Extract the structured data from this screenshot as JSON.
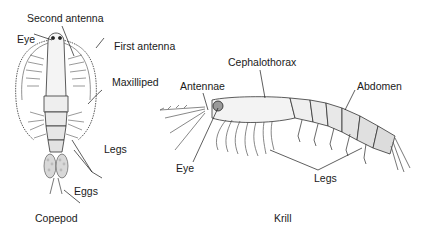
{
  "diagram": {
    "copepod": {
      "caption": "Copepod",
      "labels": {
        "second_antenna": "Second antenna",
        "eye": "Eye",
        "first_antenna": "First antenna",
        "maxilliped": "Maxilliped",
        "legs": "Legs",
        "eggs": "Eggs"
      }
    },
    "krill": {
      "caption": "Krill",
      "labels": {
        "cephalothorax": "Cephalothorax",
        "antennae": "Antennae",
        "abdomen": "Abdomen",
        "eye": "Eye",
        "legs": "Legs"
      }
    },
    "colors": {
      "background": "#ffffff",
      "ink": "#1a1a1a",
      "body_fill": "#f2f2f2",
      "shade": "#bdbdbd"
    }
  }
}
